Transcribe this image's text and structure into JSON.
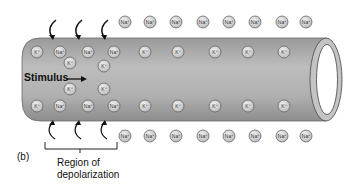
{
  "figure_label": "(b)",
  "stimulus_label": "Stimulus",
  "region_label_line1": "Region of",
  "region_label_line2": "depolarization",
  "ions": {
    "na_label": "Na+",
    "k_label": "K+"
  },
  "colors": {
    "axon_fill": "#a9a9a9",
    "axon_stroke": "#555555",
    "ion_fill": "#d8d8d8",
    "ion_stroke": "#666666"
  },
  "outside_top_na_x": [
    125,
    150,
    176,
    203,
    229,
    255,
    282,
    306
  ],
  "outside_bottom_na_x": [
    125,
    150,
    176,
    203,
    229,
    255,
    282,
    306
  ],
  "inside_top_row": [
    {
      "x": 37,
      "label": "K+"
    },
    {
      "x": 60,
      "label": "Na+"
    },
    {
      "x": 88,
      "label": "Na+"
    },
    {
      "x": 114,
      "label": "Na+"
    },
    {
      "x": 145,
      "label": "K+"
    },
    {
      "x": 178,
      "label": "K+"
    },
    {
      "x": 215,
      "label": "K+"
    },
    {
      "x": 248,
      "label": "K+"
    },
    {
      "x": 284,
      "label": "K+"
    }
  ],
  "inside_bottom_row": [
    {
      "x": 37,
      "label": "K+"
    },
    {
      "x": 60,
      "label": "Na+"
    },
    {
      "x": 88,
      "label": "Na+"
    },
    {
      "x": 114,
      "label": "Na+"
    },
    {
      "x": 145,
      "label": "K+"
    },
    {
      "x": 178,
      "label": "K+"
    },
    {
      "x": 215,
      "label": "K+"
    },
    {
      "x": 248,
      "label": "K+"
    },
    {
      "x": 284,
      "label": "K+"
    }
  ],
  "inside_middle_k": [
    {
      "x": 70,
      "y": 63
    },
    {
      "x": 104,
      "y": 66
    },
    {
      "x": 70,
      "y": 89
    },
    {
      "x": 104,
      "y": 89
    }
  ]
}
